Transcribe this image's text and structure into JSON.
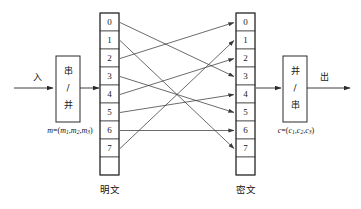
{
  "diagram": {
    "input_label": "入",
    "output_label": "出",
    "left_box": {
      "name": "serial-to-parallel-converter",
      "line1": "串",
      "line2": "/",
      "line3": "并"
    },
    "right_box": {
      "name": "parallel-to-serial-converter",
      "line1": "并",
      "line2": "/",
      "line3": "串"
    },
    "plaintext_formula": {
      "var": "m",
      "eq": "=(",
      "c1": "m",
      "s1": "1",
      "sep1": ",",
      "c2": "m",
      "s2": "2",
      "sep2": ",",
      "c3": "m",
      "s3": "3",
      "close": ")"
    },
    "ciphertext_formula": {
      "var": "c",
      "eq": "=(",
      "c1": "c",
      "s1": "1",
      "sep1": ",",
      "c2": "c",
      "s2": "2",
      "sep2": ",",
      "c3": "c",
      "s3": "3",
      "close": ")"
    },
    "left_column": {
      "label": "明文",
      "label_en": "plaintext",
      "cells": [
        "0",
        "1",
        "2",
        "3",
        "4",
        "5",
        "6",
        "7"
      ],
      "trailing_blank_cell": true
    },
    "right_column": {
      "label": "密文",
      "label_en": "ciphertext",
      "cells": [
        "0",
        "1",
        "2",
        "3",
        "4",
        "5",
        "6",
        "7"
      ],
      "trailing_blank_cell": true
    },
    "permutation": {
      "description": "mapping from plaintext bit position to ciphertext bit position",
      "pairs": [
        {
          "from": 0,
          "to": 3
        },
        {
          "from": 1,
          "to": 7
        },
        {
          "from": 2,
          "to": 0
        },
        {
          "from": 3,
          "to": 5
        },
        {
          "from": 4,
          "to": 2
        },
        {
          "from": 5,
          "to": 4
        },
        {
          "from": 6,
          "to": 6
        },
        {
          "from": 7,
          "to": 1
        }
      ]
    },
    "colors": {
      "background": "#ffffff",
      "line": "#2b2b2b",
      "cell_border": "#4a4a4a",
      "text": "#111111"
    }
  }
}
